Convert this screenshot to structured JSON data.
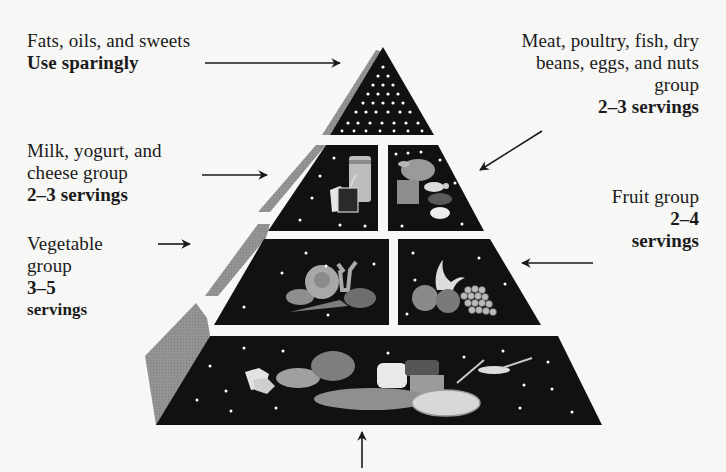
{
  "diagram": {
    "type": "food-guide-pyramid",
    "colors": {
      "background": "#f7f7f5",
      "tier_fill": "#111111",
      "bevel": "#8f8f8f",
      "separator": "#f2f2f0",
      "dots": "#ffffff",
      "food": "#9a9a9a",
      "text": "#1a1a1a"
    }
  },
  "labels": {
    "fats": {
      "lines": [
        "Fats, oils, and sweets"
      ],
      "serving": "Use sparingly"
    },
    "meat": {
      "lines": [
        "Meat, poultry, fish, dry",
        "beans, eggs, and nuts",
        "group"
      ],
      "serving": "2–3 servings"
    },
    "milk": {
      "lines": [
        "Milk, yogurt, and",
        "cheese group"
      ],
      "serving": "2–3 servings"
    },
    "fruit": {
      "lines": [
        "Fruit group"
      ],
      "serving_lines": [
        "2–4",
        "servings"
      ]
    },
    "vegetable": {
      "lines": [
        "Vegetable",
        "group"
      ],
      "serving_lines": [
        "3–5",
        "servings"
      ]
    },
    "bread": {
      "lines": [],
      "serving": ""
    }
  },
  "tiers": [
    {
      "id": "fats",
      "icon": "dots-sugar-icon"
    },
    {
      "id": "milk",
      "icon": "milk-cheese-icon"
    },
    {
      "id": "meat",
      "icon": "meat-poultry-icon"
    },
    {
      "id": "vegetable",
      "icon": "vegetables-icon"
    },
    {
      "id": "fruit",
      "icon": "fruit-icon"
    },
    {
      "id": "bread",
      "icon": "bread-grains-icon"
    }
  ]
}
